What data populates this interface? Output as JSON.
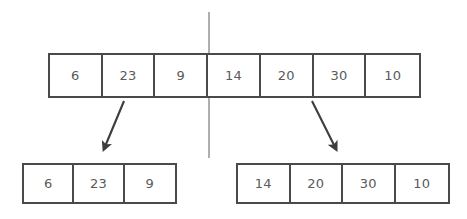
{
  "diagram": {
    "colors": {
      "border": "#4a4a4a",
      "text": "#5a5a5a",
      "divider": "#9a9a9a",
      "arrow": "#3d3d3d",
      "background": "#ffffff"
    },
    "top_array": {
      "name": "unsorted-array",
      "values": [
        "6",
        "23",
        "9",
        "14",
        "20",
        "30",
        "10"
      ]
    },
    "left_array": {
      "name": "left-half-array",
      "values": [
        "6",
        "23",
        "9"
      ]
    },
    "right_array": {
      "name": "right-half-array",
      "values": [
        "14",
        "20",
        "30",
        "10"
      ]
    },
    "divider": {
      "name": "split-line",
      "x": 209,
      "y_start": 12,
      "y_end": 158
    },
    "arrows": [
      {
        "name": "left-split-arrow",
        "x1": 124,
        "y1": 101,
        "x2": 101,
        "y2": 156
      },
      {
        "name": "right-split-arrow",
        "x1": 312,
        "y1": 101,
        "x2": 339,
        "y2": 156
      }
    ]
  }
}
